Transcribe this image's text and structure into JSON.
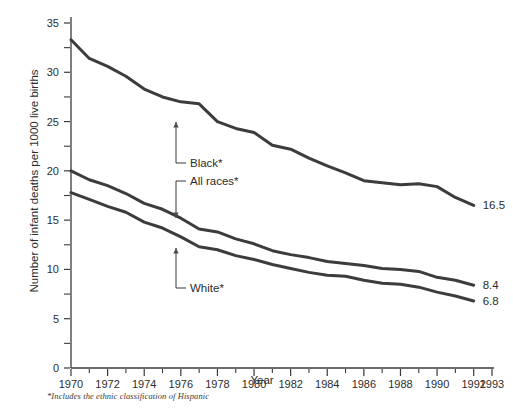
{
  "chart_data": {
    "type": "line",
    "title": "",
    "xlabel": "Year",
    "ylabel": "Number of infant deaths per 1000 live births",
    "xlim": [
      1970,
      1993
    ],
    "ylim": [
      0,
      35
    ],
    "grid": false,
    "legend_position": "inline-annotations",
    "x": [
      1970,
      1971,
      1972,
      1973,
      1974,
      1975,
      1976,
      1977,
      1978,
      1979,
      1980,
      1981,
      1982,
      1983,
      1984,
      1985,
      1986,
      1987,
      1988,
      1989,
      1990,
      1991,
      1992
    ],
    "x_tick_labels": [
      "1970",
      "1972",
      "1974",
      "1976",
      "1978",
      "1980",
      "1982",
      "1984",
      "1986",
      "1988",
      "1990",
      "1992",
      "1993"
    ],
    "x_tick_values": [
      1970,
      1972,
      1974,
      1976,
      1978,
      1980,
      1982,
      1984,
      1986,
      1988,
      1990,
      1992,
      1993
    ],
    "x_minor_tick_step": 1,
    "y_tick_labels": [
      "0",
      "5",
      "10",
      "15",
      "20",
      "25",
      "30",
      "35"
    ],
    "y_tick_values": [
      0,
      5,
      10,
      15,
      20,
      25,
      30,
      35
    ],
    "y_minor_tick_values": [
      2.5,
      7.5,
      12.5,
      17.5,
      22.5,
      27.5,
      32.5
    ],
    "series": [
      {
        "name": "Black*",
        "end_label": "16.5",
        "values": [
          33.3,
          31.4,
          30.6,
          29.6,
          28.3,
          27.5,
          27.0,
          26.8,
          25.0,
          24.3,
          23.9,
          22.6,
          22.2,
          21.3,
          20.5,
          19.8,
          19.0,
          18.8,
          18.6,
          18.7,
          18.4,
          17.3,
          16.5
        ]
      },
      {
        "name": "All races*",
        "end_label": "8.4",
        "values": [
          20.0,
          19.1,
          18.5,
          17.7,
          16.7,
          16.1,
          15.2,
          14.1,
          13.8,
          13.1,
          12.6,
          11.9,
          11.5,
          11.2,
          10.8,
          10.6,
          10.4,
          10.1,
          10.0,
          9.8,
          9.2,
          8.9,
          8.4
        ]
      },
      {
        "name": "White*",
        "end_label": "6.8",
        "values": [
          17.8,
          17.1,
          16.4,
          15.8,
          14.8,
          14.2,
          13.3,
          12.3,
          12.0,
          11.4,
          11.0,
          10.5,
          10.1,
          9.7,
          9.4,
          9.3,
          8.9,
          8.6,
          8.5,
          8.2,
          7.7,
          7.3,
          6.8
        ]
      }
    ],
    "annotations": [
      {
        "label": "Black*",
        "target_series": "Black*"
      },
      {
        "label": "All races*",
        "target_series": "All races*"
      },
      {
        "label": "White*",
        "target_series": "White*"
      }
    ],
    "footnote": "*Includes the ethnic classification of Hispanic"
  }
}
